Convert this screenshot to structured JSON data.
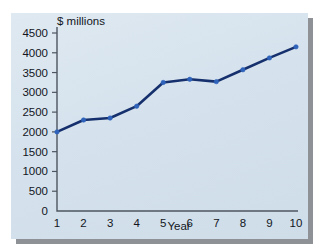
{
  "chart_data": {
    "type": "line",
    "title": "",
    "subtitle": "",
    "xlabel": "Year",
    "ylabel": "$ millions",
    "x": [
      1,
      2,
      3,
      4,
      5,
      6,
      7,
      8,
      9,
      10
    ],
    "xtick_labels": [
      "1",
      "2",
      "3",
      "4",
      "5",
      "6",
      "7",
      "8",
      "9",
      "10"
    ],
    "ytick_labels": [
      "0",
      "500",
      "1000",
      "1500",
      "2000",
      "2500",
      "3000",
      "3500",
      "4000",
      "4500"
    ],
    "ytick_values": [
      0,
      500,
      1000,
      1500,
      2000,
      2500,
      3000,
      3500,
      4000,
      4500
    ],
    "ylim": [
      0,
      4500
    ],
    "xlim": [
      1,
      10
    ],
    "grid": false,
    "legend": null,
    "series": [
      {
        "name": "$ millions",
        "color": "#15306d",
        "marker_color": "#2f63bb",
        "values": [
          2000,
          2300,
          2350,
          2650,
          3250,
          3330,
          3270,
          3570,
          3870,
          4150
        ]
      }
    ]
  },
  "panel": {
    "background_color": "#d7e3ee",
    "shadow_color": "#8e9296"
  }
}
